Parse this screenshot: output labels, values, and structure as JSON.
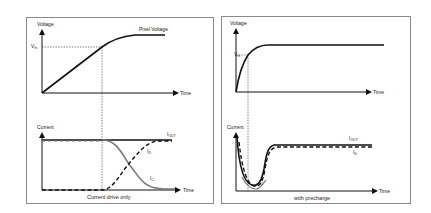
{
  "left_panel": {
    "caption": "Current drive only",
    "voltage_axis_label": "Voltage",
    "time_axis_label_top": "Time",
    "vth_label": "V",
    "vth_sub": "th",
    "pixel_voltage_label": "Pixel Voltage",
    "current_axis_label": "Current",
    "time_axis_label_bottom": "Time",
    "iout_label": "I",
    "iout_sub": "OUT",
    "id_label": "I",
    "id_sub": "D",
    "ic_label": "I",
    "ic_sub": "C"
  },
  "right_panel": {
    "caption": "with precharge",
    "voltage_axis_label": "Voltage",
    "time_axis_label_top": "Time",
    "vth_label": "V",
    "vth_sub": "th",
    "current_axis_label": "Current",
    "time_axis_label_bottom": "Time",
    "iout_label": "I",
    "iout_sub": "OUT",
    "id_label": "I",
    "id_sub": "D",
    "ic_label": "I",
    "ic_sub": "C"
  },
  "colors": {
    "line": "#111111",
    "gray_curve": "#777777",
    "border": "#8a8a8a",
    "guide": "#333333"
  }
}
